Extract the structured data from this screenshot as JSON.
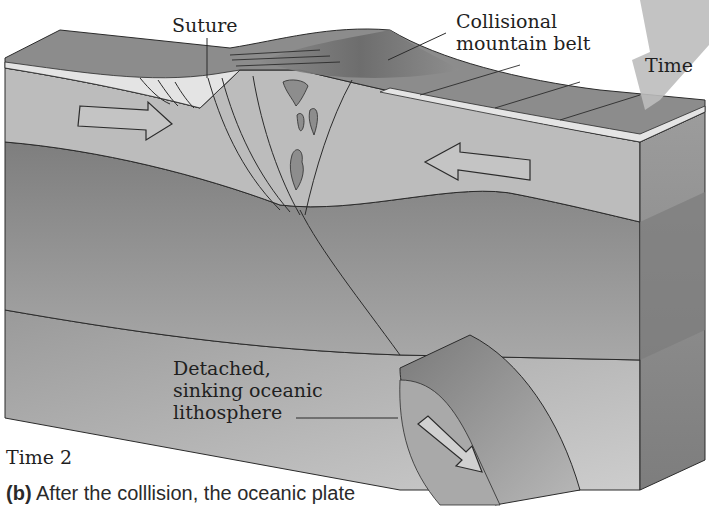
{
  "figure": {
    "panel_tag": "(b)",
    "caption_text": "After the colllision, the oceanic plate",
    "time_label": "Time 2"
  },
  "labels": {
    "suture": "Suture",
    "collisional_mountain_belt": "Collisional\nmountain belt",
    "time_arrow": "Time",
    "detached_lithosphere": "Detached,\nsinking oceanic\nlithosphere"
  },
  "arrows": {
    "left_plate_motion": "right",
    "right_plate_motion": "left",
    "sinking_slab_motion": "down-right",
    "time_arrow_direction": "down-left"
  },
  "colors": {
    "background": "#ffffff",
    "surface_top": "#8a8a8a",
    "crust_light": "#b9b9b9",
    "sediment_white": "#e6e6e6",
    "lithosphere_dark": "#8f8f8f",
    "asthenosphere": "#a9a9a9",
    "mantle_light": "#c4c4c4",
    "time_arrow": "#bdbdbd",
    "outline": "#2b2b2b"
  }
}
